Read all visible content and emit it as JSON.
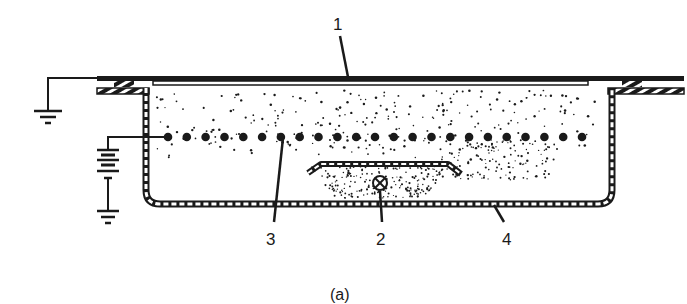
{
  "figure": {
    "caption": "(a)",
    "labels": {
      "top_plate": "1",
      "heater": "2",
      "wire_electrode": "3",
      "container": "4"
    },
    "colors": {
      "ink": "#1a1a1a",
      "background": "#ffffff"
    },
    "components": [
      {
        "id": "1",
        "name": "top-plate",
        "description": "grounded top cover plate"
      },
      {
        "id": "2",
        "name": "heater-source",
        "description": "source under shielded tray (circle with X)"
      },
      {
        "id": "3",
        "name": "wire-electrode-row",
        "description": "row of beads connected to battery"
      },
      {
        "id": "4",
        "name": "container",
        "description": "hatched-wall tray/vessel"
      }
    ],
    "symbols": [
      "ground-symbol",
      "ground-symbol",
      "battery-symbol"
    ],
    "bead_count": 23
  }
}
